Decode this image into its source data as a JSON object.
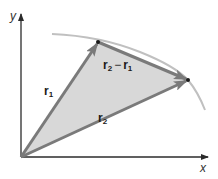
{
  "figure": {
    "type": "vector-diagram",
    "axes": {
      "x_label": "x",
      "y_label": "y",
      "origin": [
        21,
        157
      ]
    },
    "vectors": [
      {
        "name": "r1",
        "base": "r",
        "sub": "1",
        "from": [
          21,
          157
        ],
        "to": [
          98,
          42
        ]
      },
      {
        "name": "r2",
        "base": "r",
        "sub": "2",
        "from": [
          21,
          157
        ],
        "to": [
          188,
          80
        ]
      },
      {
        "name": "r2-r1",
        "from": [
          98,
          42
        ],
        "to": [
          188,
          80
        ]
      }
    ],
    "labels": {
      "r1": {
        "base": "r",
        "sub": "1"
      },
      "r2": {
        "base": "r",
        "sub": "2"
      },
      "diff": {
        "a_base": "r",
        "a_sub": "2",
        "op": "−",
        "b_base": "r",
        "b_sub": "1"
      }
    },
    "colors": {
      "axis": "#2b2b2b",
      "vector": "#7a7a7a",
      "fill": "#d8d8d8",
      "curve": "#bdbdbd",
      "point": "#1a1a1a"
    }
  }
}
